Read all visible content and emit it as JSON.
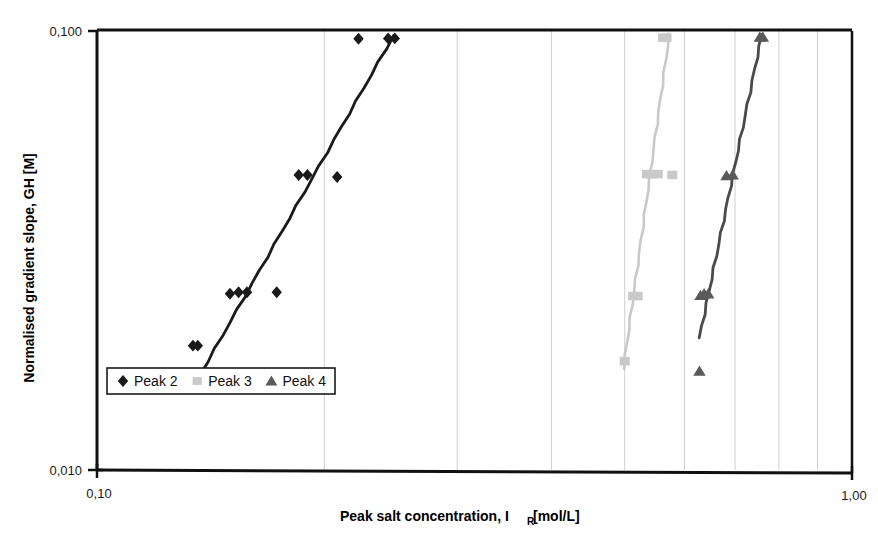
{
  "chart_data": {
    "type": "scatter",
    "title": "",
    "xlabel": "Peak salt concentration, I_R [mol/L]",
    "xlabel_main": "Peak salt concentration, I",
    "xlabel_sub": "R",
    "xlabel_tail": " [mol/L]",
    "ylabel": "Normalised gradient slope, GH [M]",
    "xscale": "log",
    "yscale": "log",
    "xlim": [
      0.1,
      1.0
    ],
    "ylim": [
      0.01,
      0.1
    ],
    "xticks": [
      0.1,
      1.0
    ],
    "xtick_labels": [
      "0,10",
      "1,00"
    ],
    "yticks": [
      0.01,
      0.1
    ],
    "ytick_labels": [
      "0,010",
      "0,100"
    ],
    "grid": "minor-vertical-only",
    "x_gridlines": [
      0.2,
      0.3,
      0.4,
      0.5,
      0.6,
      0.7,
      0.8,
      0.9
    ],
    "legend_position": "inside-lower-left",
    "series": [
      {
        "name": "Peak 2",
        "marker": "diamond",
        "color": "#1a1a1a",
        "line_color": "#1a1a1a",
        "points": [
          {
            "x": 0.134,
            "y": 0.0192
          },
          {
            "x": 0.136,
            "y": 0.0192
          },
          {
            "x": 0.15,
            "y": 0.0252
          },
          {
            "x": 0.154,
            "y": 0.0254
          },
          {
            "x": 0.158,
            "y": 0.0254
          },
          {
            "x": 0.173,
            "y": 0.0254
          },
          {
            "x": 0.185,
            "y": 0.047
          },
          {
            "x": 0.19,
            "y": 0.047
          },
          {
            "x": 0.208,
            "y": 0.0465
          },
          {
            "x": 0.222,
            "y": 0.096
          },
          {
            "x": 0.243,
            "y": 0.0962
          },
          {
            "x": 0.248,
            "y": 0.0962
          }
        ],
        "fit_line": {
          "x1": 0.137,
          "y1": 0.0165,
          "x2": 0.247,
          "y2": 0.0975
        }
      },
      {
        "name": "Peak 3",
        "marker": "square",
        "color": "#c9c9c9",
        "line_color": "#c9c9c9",
        "points": [
          {
            "x": 0.5,
            "y": 0.0177
          },
          {
            "x": 0.513,
            "y": 0.0249
          },
          {
            "x": 0.52,
            "y": 0.0249
          },
          {
            "x": 0.535,
            "y": 0.0472
          },
          {
            "x": 0.543,
            "y": 0.0472
          },
          {
            "x": 0.553,
            "y": 0.0472
          },
          {
            "x": 0.578,
            "y": 0.047
          },
          {
            "x": 0.562,
            "y": 0.0965
          },
          {
            "x": 0.568,
            "y": 0.0965
          }
        ],
        "fit_line": {
          "x1": 0.498,
          "y1": 0.017,
          "x2": 0.573,
          "y2": 0.0985
        }
      },
      {
        "name": "Peak 4",
        "marker": "triangle",
        "color": "#5a5a5a",
        "line_color": "#4a4a4a",
        "points": [
          {
            "x": 0.628,
            "y": 0.0168
          },
          {
            "x": 0.63,
            "y": 0.025
          },
          {
            "x": 0.637,
            "y": 0.0252
          },
          {
            "x": 0.645,
            "y": 0.0252
          },
          {
            "x": 0.682,
            "y": 0.0468
          },
          {
            "x": 0.695,
            "y": 0.047
          },
          {
            "x": 0.755,
            "y": 0.0968
          },
          {
            "x": 0.762,
            "y": 0.0968
          }
        ],
        "fit_line": {
          "x1": 0.628,
          "y1": 0.02,
          "x2": 0.76,
          "y2": 0.0985
        }
      }
    ],
    "legend": [
      {
        "label": "Peak 2",
        "marker": "diamond",
        "color": "#1a1a1a"
      },
      {
        "label": "Peak 3",
        "marker": "square",
        "color": "#c9c9c9"
      },
      {
        "label": "Peak 4",
        "marker": "triangle",
        "color": "#5a5a5a"
      }
    ]
  },
  "plot_geometry": {
    "left": 97,
    "right": 852,
    "top": 31,
    "bottom": 470
  }
}
